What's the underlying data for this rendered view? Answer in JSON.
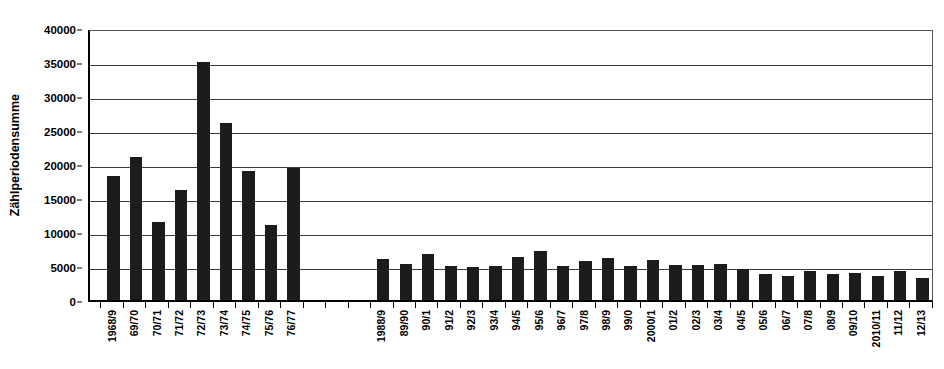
{
  "chart_data": {
    "type": "bar",
    "title": "",
    "xlabel": "",
    "ylabel": "Zählperiodensumme",
    "ylim": [
      0,
      40000
    ],
    "ytick_values": [
      0,
      5000,
      10000,
      15000,
      20000,
      25000,
      30000,
      35000,
      40000
    ],
    "ytick_labels": [
      "0",
      "5000",
      "10000",
      "15000",
      "20000",
      "25000",
      "30000",
      "35000",
      "40000"
    ],
    "grid": true,
    "legend": null,
    "bar_color": "#1c1c1c",
    "groups": [
      {
        "name": "1968/9-1976/7",
        "categories": [
          "1968/9",
          "69/70",
          "70/71",
          "71/72",
          "72/73",
          "73/74",
          "74/75",
          "75/76",
          "76/77"
        ],
        "values": [
          18300,
          21000,
          11400,
          16200,
          35000,
          26000,
          19000,
          11000,
          19400
        ]
      },
      {
        "name": "1988/9-2012/13",
        "categories": [
          "1988/9",
          "89/90",
          "90/1",
          "91/2",
          "92/3",
          "93/4",
          "94/5",
          "95/6",
          "96/7",
          "97/8",
          "98/9",
          "99/0",
          "2000/1",
          "01/2",
          "02/3",
          "03/4",
          "04/5",
          "05/6",
          "06/7",
          "07/8",
          "08/9",
          "09/10",
          "2010/11",
          "11/12",
          "12/13"
        ],
        "values": [
          6100,
          5300,
          6700,
          5000,
          4900,
          5000,
          6300,
          7200,
          5000,
          5800,
          6200,
          5000,
          5900,
          5200,
          5200,
          5300,
          4500,
          3800,
          3600,
          4200,
          3800,
          4000,
          3500,
          4200,
          3300
        ]
      }
    ],
    "gap_slots_between_groups": 3
  }
}
